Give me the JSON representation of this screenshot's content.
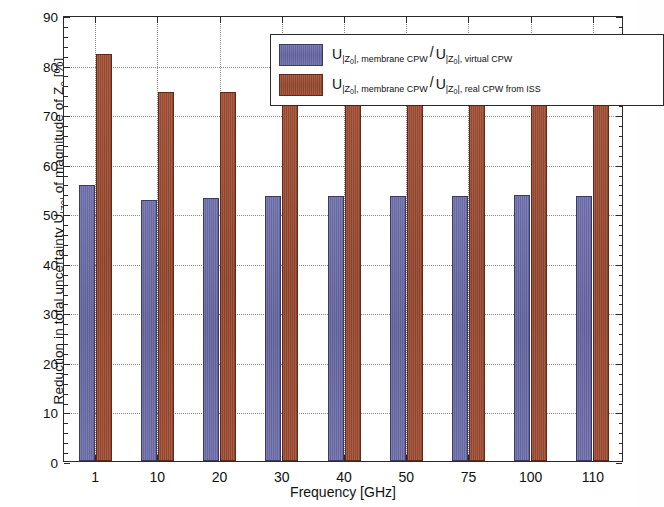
{
  "chart_data": {
    "type": "bar",
    "title": "",
    "xlabel": "Frequency [GHz]",
    "ylabel": "Reduction in total uncertainty U|Z0| of magnitude of Z0 [%]",
    "categories": [
      "1",
      "10",
      "20",
      "30",
      "40",
      "50",
      "75",
      "100",
      "110"
    ],
    "ylim": [
      0,
      90
    ],
    "ytick_labels": [
      "0",
      "10",
      "20",
      "30",
      "40",
      "50",
      "60",
      "70",
      "80",
      "90"
    ],
    "ytick_values": [
      0,
      10,
      20,
      30,
      40,
      50,
      60,
      70,
      80,
      90
    ],
    "grid": true,
    "legend_position": "top-center",
    "series": [
      {
        "name": "U|Z0|, membrane CPW / U|Z0|, virtual CPW",
        "color": "#6b6ca6",
        "values": [
          55.6,
          52.6,
          53.0,
          53.4,
          53.5,
          53.5,
          53.4,
          53.7,
          53.4
        ]
      },
      {
        "name": "U|Z0|, membrane CPW / U|Z0|, real CPW from ISS",
        "color": "#9b4a31",
        "values": [
          82.2,
          74.4,
          74.5,
          74.6,
          74.6,
          74.6,
          74.6,
          74.6,
          74.6
        ]
      }
    ]
  },
  "axes": {
    "x_title": "Frequency [GHz]",
    "y_title_parts": {
      "lead": "Reduction in total uncertainty  U",
      "sub1": "|Z",
      "sub1_tiny": "0",
      "sub1_end": "|",
      "mid": " of magnitude of Z",
      "sub2": "0",
      "units": " [%]"
    }
  },
  "legend": {
    "entries": [
      {
        "swatch": "series-0-swatch",
        "num_sym": "U",
        "num_sub_a": "|Z",
        "num_sub_tiny": "0",
        "num_sub_b": "|, membrane CPW",
        "divider": "/",
        "den_sym": "U",
        "den_sub_a": "|Z",
        "den_sub_tiny": "0",
        "den_sub_b": "|, virtual CPW"
      },
      {
        "swatch": "series-1-swatch",
        "num_sym": "U",
        "num_sub_a": "|Z",
        "num_sub_tiny": "0",
        "num_sub_b": "|, membrane CPW",
        "divider": "/",
        "den_sym": "U",
        "den_sub_a": "|Z",
        "den_sub_tiny": "0",
        "den_sub_b": "|, real CPW from ISS"
      }
    ]
  }
}
